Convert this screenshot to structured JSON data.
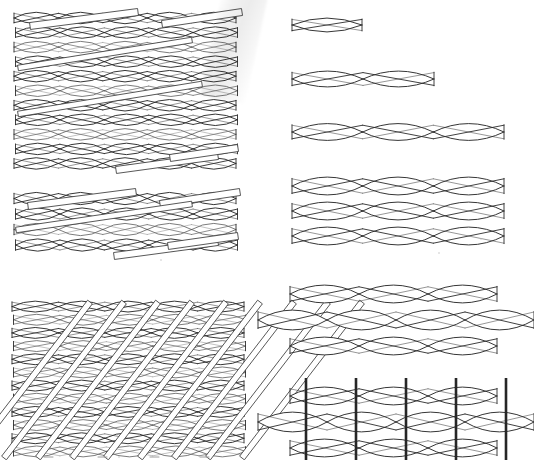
{
  "figure": {
    "background_color": "#ffffff",
    "ink_color": "#2b2b2b",
    "binder_color": "#262626",
    "width": 534,
    "height": 460
  },
  "panels": [
    {
      "id": "panel-woven-large-top-left",
      "name": "large-woven-fabric-patch",
      "label": "Dense woven fabric patch (large)",
      "position": {
        "x": 12,
        "y": 10,
        "width": 222,
        "height": 160
      },
      "rows": 11,
      "repeats_per_row": 5,
      "has_diagonal_tows": true,
      "diagonal_tow_count": 4,
      "unit_color": "#2b2b2b"
    },
    {
      "id": "panel-woven-small-mid-left",
      "name": "small-woven-fabric-patch",
      "label": "Dense woven fabric patch (small)",
      "position": {
        "x": 12,
        "y": 190,
        "width": 222,
        "height": 62
      },
      "rows": 4,
      "repeats_per_row": 5,
      "has_diagonal_tows": true,
      "diagonal_tow_count": 4,
      "unit_color": "#2b2b2b"
    },
    {
      "id": "panel-woven-dense-bottom-left",
      "name": "dense-braided-fabric-patch",
      "label": "Dense braided fabric patch with steep bias tows",
      "position": {
        "x": 10,
        "y": 300,
        "width": 232,
        "height": 158
      },
      "rows": 12,
      "repeats_per_row": 5,
      "has_diagonal_tows": true,
      "diagonal_tow_count": 9,
      "unit_color": "#2b2b2b"
    },
    {
      "id": "panel-unit-cell",
      "name": "single-twisted-yarn-unit",
      "label": "Single twisted yarn unit cell",
      "position": {
        "x": 290,
        "y": 10,
        "width": 70,
        "height": 26
      },
      "rows": 1,
      "repeats_per_row": 1,
      "has_diagonal_tows": false,
      "unit_color": "#2b2b2b"
    },
    {
      "id": "panel-two-repeat",
      "name": "two-repeat-twisted-yarn",
      "label": "Two-repeat twisted yarn",
      "position": {
        "x": 290,
        "y": 64,
        "width": 142,
        "height": 26
      },
      "rows": 1,
      "repeats_per_row": 2,
      "has_diagonal_tows": false,
      "unit_color": "#2b2b2b"
    },
    {
      "id": "panel-three-repeat",
      "name": "three-repeat-twisted-yarn",
      "label": "Three-repeat twisted yarn",
      "position": {
        "x": 290,
        "y": 117,
        "width": 212,
        "height": 26
      },
      "rows": 1,
      "repeats_per_row": 3,
      "has_diagonal_tows": false,
      "unit_color": "#2b2b2b"
    },
    {
      "id": "panel-three-layer-stack",
      "name": "three-layer-yarn-stack",
      "label": "Three stacked twisted-yarn layers",
      "position": {
        "x": 290,
        "y": 172,
        "width": 212,
        "height": 72
      },
      "rows": 3,
      "repeats_per_row": 3,
      "has_diagonal_tows": false,
      "unit_color": "#2b2b2b"
    },
    {
      "id": "panel-offset-stack",
      "name": "offset-three-layer-yarn-stack",
      "label": "Three-layer stack with offset wider middle layer",
      "position": {
        "x": 262,
        "y": 280,
        "width": 262,
        "height": 72
      },
      "rows": 3,
      "repeats_per_row": 3,
      "middle_row_repeats": 4,
      "has_diagonal_tows": false,
      "unit_color": "#2b2b2b"
    },
    {
      "id": "panel-binder-stack",
      "name": "three-layer-stack-with-z-binders",
      "label": "Three-layer stack with vertical z-direction binder yarns",
      "position": {
        "x": 262,
        "y": 378,
        "width": 262,
        "height": 78
      },
      "rows": 3,
      "repeats_per_row": 3,
      "middle_row_repeats": 4,
      "binder_count": 5,
      "has_diagonal_tows": false,
      "unit_color": "#2b2b2b",
      "binder_color": "#262626"
    }
  ],
  "artifacts": {
    "scan_smudge": {
      "name": "scan-shadow-smudge",
      "position": {
        "x": 222,
        "y": -4,
        "width": 46,
        "height": 104
      },
      "rotation_deg": 12,
      "color": "#e8e8e8"
    },
    "specks": [
      {
        "x": 160,
        "y": 259,
        "size": 2
      },
      {
        "x": 480,
        "y": 238,
        "size": 2
      },
      {
        "x": 438,
        "y": 252,
        "size": 2
      },
      {
        "x": 70,
        "y": 455,
        "size": 2
      },
      {
        "x": 118,
        "y": 456,
        "size": 2
      },
      {
        "x": 172,
        "y": 456,
        "size": 2
      }
    ]
  }
}
